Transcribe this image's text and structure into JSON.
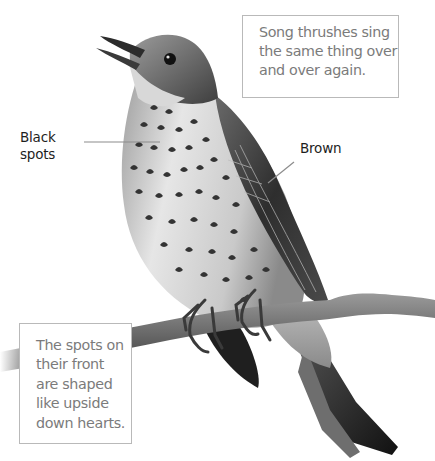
{
  "illustration": {
    "subject": "song thrush perched on a branch",
    "palette": {
      "background": "#ffffff",
      "plumage_light": "#e2e2e2",
      "plumage_mid": "#9a9a9a",
      "plumage_dark": "#2a2a2a",
      "spots": "#3a3a3a",
      "branch": "#6e6e6e",
      "leader_line": "#8c8c8c",
      "note_border": "#b9b9b9",
      "note_text": "#7b7b7b",
      "label_text": "#1e1e1e"
    }
  },
  "labels": {
    "black_spots": [
      "Black",
      "spots"
    ],
    "brown": "Brown"
  },
  "notes": {
    "top": [
      "Song thrushes sing",
      "the same thing over",
      "and over again."
    ],
    "bottom": [
      "The spots on",
      "their front",
      "are shaped",
      "like upside",
      "down hearts."
    ]
  }
}
